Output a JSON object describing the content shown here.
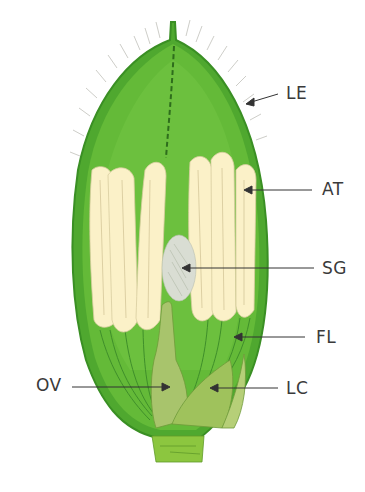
{
  "diagram": {
    "colors": {
      "lemma_dark": "#3f9a2a",
      "lemma_fill": "#5cb535",
      "inner_fill": "#6fc040",
      "anther": "#fbf1c6",
      "stigma": "#d8ddd2",
      "ovary": "#a9c46a",
      "lodicule": "#9fc25c",
      "stem": "#8cc63f"
    },
    "labels": [
      {
        "id": "LE",
        "text": "LE"
      },
      {
        "id": "AT",
        "text": "AT"
      },
      {
        "id": "SG",
        "text": "SG"
      },
      {
        "id": "FL",
        "text": "FL"
      },
      {
        "id": "OV",
        "text": "OV"
      },
      {
        "id": "LC",
        "text": "LC"
      }
    ]
  }
}
